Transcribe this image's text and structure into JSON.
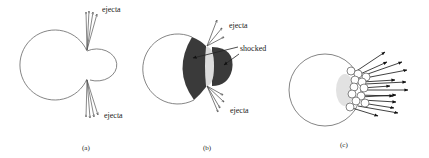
{
  "panels": [
    {
      "id": "a",
      "caption": "(a)",
      "labels": {
        "ejecta_top": "ejecta",
        "ejecta_bottom": "ejecta"
      }
    },
    {
      "id": "b",
      "caption": "(b)",
      "labels": {
        "ejecta_top": "ejecta",
        "shocked": "shocked",
        "ejecta_bottom": "ejecta"
      }
    },
    {
      "id": "c",
      "caption": "(c)"
    }
  ],
  "colors": {
    "line": "#555555",
    "shocked": "#3a3a3a",
    "core": "#d8d8d8",
    "arrow": "#111111"
  }
}
